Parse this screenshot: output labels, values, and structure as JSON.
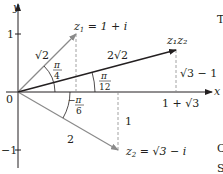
{
  "diagram": {
    "axes": {
      "x_label": "x",
      "y_label": "y",
      "origin_label": "0",
      "y_tick_pos": "1",
      "y_tick_neg": "−1"
    },
    "vectors": {
      "z1": {
        "label_left": "z",
        "label_sub": "1",
        "label_right": " = 1 + i",
        "modulus": "√2",
        "angle_num": "π",
        "angle_den": "4",
        "color": "#8a8a8a"
      },
      "z2": {
        "label_left": "z",
        "label_sub": "2",
        "label_right": " = √3 − i",
        "modulus": "2",
        "angle_num": "−π",
        "angle_den": "6",
        "dashed_height": "1",
        "color": "#8a8a8a"
      },
      "z1z2": {
        "label": "z₁z₂",
        "modulus": "2√2",
        "angle_num": "π",
        "angle_den": "12",
        "dashed_height": "√3 − 1",
        "x_value": "1 + √3",
        "color": "#231f20"
      }
    },
    "edge_text": [
      "T",
      "C",
      "S"
    ]
  }
}
